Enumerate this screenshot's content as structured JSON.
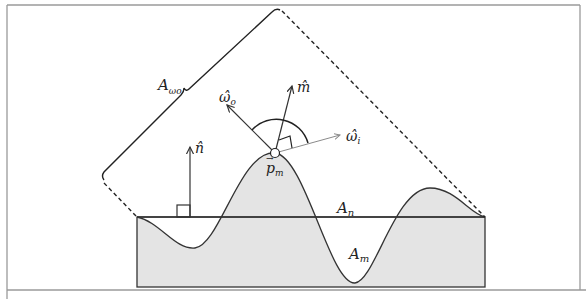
{
  "figure": {
    "type": "microfacet-geometry-diagram",
    "labels": {
      "A_omega_o": {
        "base": "A",
        "sub": "ωo"
      },
      "A_n": {
        "base": "A",
        "sub": "n"
      },
      "A_m": {
        "base": "A",
        "sub": "m"
      },
      "n_hat": "n̂",
      "m_hat": "m̂",
      "omega_o_hat": "ω̂",
      "omega_o_sub": "o",
      "omega_i_hat": "ω̂",
      "omega_i_sub": "i",
      "p_m": "p",
      "p_m_sub": "m",
      "p_m_arrow": "→"
    },
    "colors": {
      "stroke": "#333333",
      "shade": "#e4e4e4",
      "frame": "#9a9a9a",
      "omega_i_arrow": "#8a8a8a"
    }
  }
}
